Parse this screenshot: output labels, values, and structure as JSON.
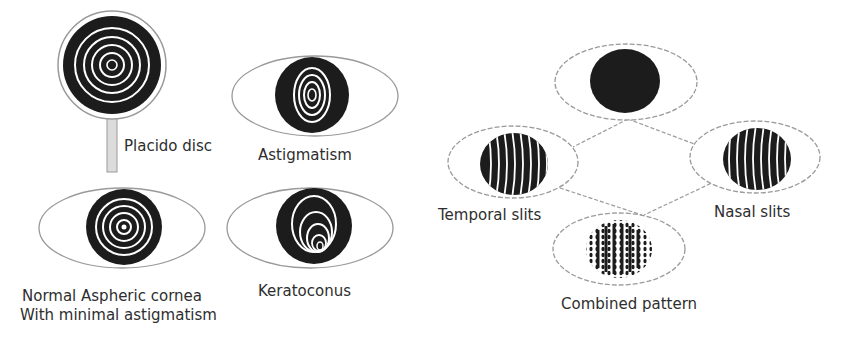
{
  "left_panel": {
    "placido_disc": {
      "label": "Placido disc"
    },
    "astigmatism": {
      "label": "Astigmatism"
    },
    "normal": {
      "label_line1": "Normal Aspheric cornea",
      "label_line2": "With minimal astigmatism"
    },
    "keratoconus": {
      "label": "Keratoconus"
    }
  },
  "right_panel": {
    "top_eye": {
      "label": ""
    },
    "temporal": {
      "label": "Temporal slits"
    },
    "nasal": {
      "label": "Nasal slits"
    },
    "combined": {
      "label": "Combined pattern"
    }
  },
  "colors": {
    "iris": "#1c1c1c",
    "ring": "#ffffff",
    "outline": "#9a9a9a",
    "text": "#2e2e2e"
  }
}
